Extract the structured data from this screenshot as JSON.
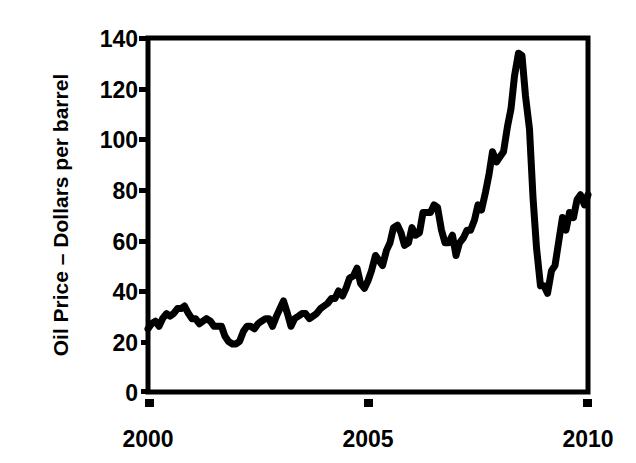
{
  "chart_data": {
    "type": "line",
    "title": "",
    "subtitle": "",
    "xlabel": "",
    "ylabel": "Oil Price – Dollars per barrel",
    "xlim": [
      2000,
      2010
    ],
    "ylim": [
      0,
      140
    ],
    "x_ticks": [
      2000,
      2005,
      2010
    ],
    "x_tick_labels": [
      "2000",
      "2005",
      "2010"
    ],
    "y_ticks": [
      0,
      20,
      40,
      60,
      80,
      100,
      120,
      140
    ],
    "y_tick_labels": [
      "0",
      "20",
      "40",
      "60",
      "80",
      "100",
      "120",
      "140"
    ],
    "grid": false,
    "legend": null,
    "legend_position": "none",
    "series": [
      {
        "name": "Oil Price",
        "color": "#000000",
        "x": [
          2000.0,
          2000.08,
          2000.17,
          2000.25,
          2000.33,
          2000.42,
          2000.5,
          2000.58,
          2000.67,
          2000.75,
          2000.83,
          2000.92,
          2001.0,
          2001.08,
          2001.17,
          2001.25,
          2001.33,
          2001.42,
          2001.5,
          2001.58,
          2001.67,
          2001.75,
          2001.83,
          2001.92,
          2002.0,
          2002.08,
          2002.17,
          2002.25,
          2002.33,
          2002.42,
          2002.5,
          2002.58,
          2002.67,
          2002.75,
          2002.83,
          2002.92,
          2003.0,
          2003.08,
          2003.17,
          2003.25,
          2003.33,
          2003.42,
          2003.5,
          2003.58,
          2003.67,
          2003.75,
          2003.83,
          2003.92,
          2004.0,
          2004.08,
          2004.17,
          2004.25,
          2004.33,
          2004.42,
          2004.5,
          2004.58,
          2004.67,
          2004.75,
          2004.83,
          2004.92,
          2005.0,
          2005.08,
          2005.17,
          2005.25,
          2005.33,
          2005.42,
          2005.5,
          2005.58,
          2005.67,
          2005.75,
          2005.83,
          2005.92,
          2006.0,
          2006.08,
          2006.17,
          2006.25,
          2006.33,
          2006.42,
          2006.5,
          2006.58,
          2006.67,
          2006.75,
          2006.83,
          2006.92,
          2007.0,
          2007.08,
          2007.17,
          2007.25,
          2007.33,
          2007.42,
          2007.5,
          2007.58,
          2007.67,
          2007.75,
          2007.83,
          2007.92,
          2008.0,
          2008.08,
          2008.17,
          2008.25,
          2008.33,
          2008.42,
          2008.5,
          2008.58,
          2008.67,
          2008.75,
          2008.83,
          2008.92,
          2009.0,
          2009.08,
          2009.17,
          2009.25,
          2009.33,
          2009.42,
          2009.5,
          2009.58,
          2009.67,
          2009.75,
          2009.83,
          2009.92,
          2010.0
        ],
        "y": [
          25,
          27,
          28,
          26,
          29,
          31,
          30,
          31,
          33,
          33,
          34,
          31,
          29,
          29,
          27,
          28,
          29,
          28,
          26,
          26,
          26,
          22,
          20,
          19,
          19,
          20,
          24,
          26,
          26,
          25,
          27,
          28,
          29,
          29,
          26,
          30,
          33,
          36,
          31,
          26,
          29,
          30,
          31,
          31,
          29,
          30,
          31,
          33,
          34,
          35,
          37,
          37,
          40,
          38,
          41,
          45,
          46,
          49,
          43,
          41,
          44,
          48,
          54,
          52,
          50,
          56,
          59,
          65,
          66,
          63,
          58,
          59,
          65,
          62,
          63,
          71,
          71,
          71,
          74,
          73,
          64,
          59,
          59,
          62,
          54,
          59,
          61,
          64,
          64,
          68,
          74,
          72,
          79,
          86,
          95,
          91,
          93,
          95,
          105,
          112,
          125,
          134,
          133,
          117,
          104,
          77,
          57,
          42,
          42,
          39,
          48,
          50,
          59,
          69,
          64,
          71,
          69,
          76,
          78,
          74,
          78
        ]
      }
    ]
  },
  "axes": {
    "y_axis_label": "Oil Price – Dollars per barrel",
    "x_axis_label": ""
  }
}
